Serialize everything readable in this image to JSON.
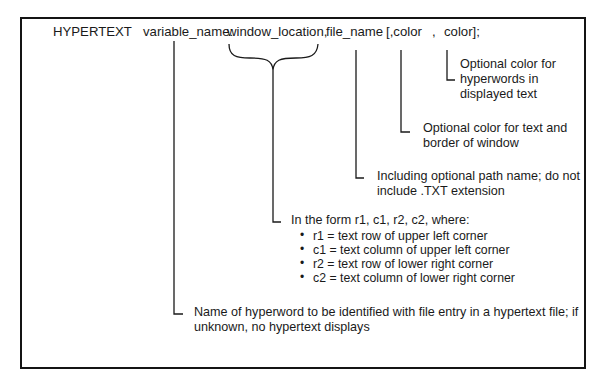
{
  "syntax": {
    "keyword": "HYPERTEXT",
    "variable_name": "variable_name:",
    "window_location": "window_location,",
    "file_name": "file_name",
    "color_part_1": "[,color",
    "comma": ",",
    "color_part_2": "color];"
  },
  "annotations": {
    "hyperword_color": [
      "Optional color for",
      "hyperwords in",
      "displayed text"
    ],
    "text_border_color": [
      "Optional color for text and",
      "border of window"
    ],
    "file_name": [
      "Including optional path name; do not",
      "include .TXT extension"
    ],
    "window_location": {
      "intro": "In the form r1, c1, r2, c2, where:",
      "bullet_glyph": "•",
      "items": [
        "r1 = text row of upper left corner",
        "c1 = text column of upper left corner",
        "r2 = text row of lower right corner",
        "c2 = text column of lower right corner"
      ]
    },
    "variable_name": [
      "Name of hyperword to be identified with file entry in a hypertext file; if",
      "unknown, no hypertext displays"
    ]
  },
  "colors": {
    "ink": "#1a1a1a",
    "background": "#ffffff"
  }
}
